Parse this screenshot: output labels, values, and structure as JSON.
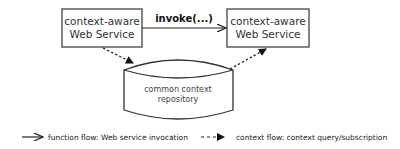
{
  "diagram": {
    "nodes": {
      "left_service": {
        "line1": "context-aware",
        "line2": "Web Service"
      },
      "right_service": {
        "line1": "context-aware",
        "line2": "Web Service"
      },
      "repository": {
        "line1": "common context",
        "line2": "repository"
      }
    },
    "edges": {
      "invoke": {
        "label": "invoke(...)",
        "from": "left_service",
        "to": "right_service",
        "style": "solid"
      },
      "left_to_repo": {
        "from": "left_service",
        "to": "repository",
        "style": "dashed"
      },
      "repo_to_right": {
        "from": "repository",
        "to": "right_service",
        "style": "dashed"
      }
    },
    "legend": {
      "function_flow": "function flow:  Web service invocation",
      "context_flow": "context flow: context query/subscription"
    },
    "colors": {
      "stroke": "#333333",
      "background": "#ffffff"
    }
  }
}
